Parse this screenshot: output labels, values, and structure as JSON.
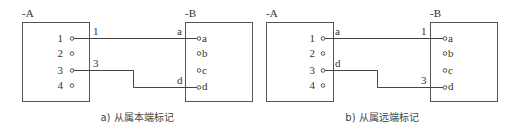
{
  "panels": [
    {
      "id": "a",
      "caption": "a) 从属本端标记",
      "device_a": {
        "label": "-A",
        "terminals": [
          "1",
          "2",
          "3",
          "4"
        ]
      },
      "device_b": {
        "label": "-B",
        "terminals": [
          "a",
          "b",
          "c",
          "d"
        ]
      },
      "wires": [
        {
          "from": "1",
          "to": "a",
          "near_a_mark": "1",
          "near_b_mark": "a"
        },
        {
          "from": "3",
          "to": "d",
          "near_a_mark": "3",
          "near_b_mark": "d"
        }
      ]
    },
    {
      "id": "b",
      "caption": "b) 从属远端标记",
      "device_a": {
        "label": "-A",
        "terminals": [
          "1",
          "2",
          "3",
          "4"
        ]
      },
      "device_b": {
        "label": "-B",
        "terminals": [
          "a",
          "b",
          "c",
          "d"
        ]
      },
      "wires": [
        {
          "from": "1",
          "to": "a",
          "near_a_mark": "a",
          "near_b_mark": "1"
        },
        {
          "from": "3",
          "to": "d",
          "near_a_mark": "d",
          "near_b_mark": "3"
        }
      ]
    }
  ]
}
